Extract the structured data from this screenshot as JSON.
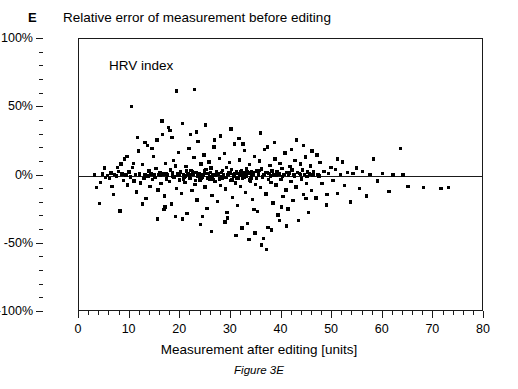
{
  "panel": {
    "letter": "E",
    "caption": "Figure 3E"
  },
  "chart_data": {
    "type": "scatter",
    "title": "Relative error of measurement before editing",
    "annotation": "HRV index",
    "xlabel": "Measurement after editing [units]",
    "ylabel": "",
    "xlim": [
      0,
      80
    ],
    "ylim": [
      -100,
      100
    ],
    "x_major_ticks": [
      0,
      10,
      20,
      30,
      40,
      50,
      60,
      70,
      80
    ],
    "x_tick_labels": [
      "0",
      "10",
      "20",
      "30",
      "40",
      "50",
      "60",
      "70",
      "80"
    ],
    "x_minor_interval": 2,
    "y_major_ticks": [
      100,
      50,
      0,
      -50,
      -100
    ],
    "y_tick_labels": [
      "100%",
      "50%",
      "0%",
      "-50%",
      "-100%"
    ],
    "y_minor_interval": 10,
    "grid": false,
    "legend": null,
    "reference_line": {
      "y": 0,
      "style": "solid",
      "color": "#1a1a1a"
    },
    "marker": {
      "shape": "square",
      "color": "#000000",
      "size_px": 3.4
    },
    "n_points": 520,
    "points": [
      [
        3.1,
        0.5
      ],
      [
        3.4,
        -9.0
      ],
      [
        4.0,
        -20.5
      ],
      [
        4.6,
        1.0
      ],
      [
        5.2,
        -1.5
      ],
      [
        5.6,
        0.2
      ],
      [
        6.0,
        -2.0
      ],
      [
        6.3,
        1.8
      ],
      [
        6.8,
        -14.0
      ],
      [
        7.0,
        0.8
      ],
      [
        7.4,
        -0.5
      ],
      [
        7.8,
        3.0
      ],
      [
        8.1,
        -26.0
      ],
      [
        8.5,
        1.2
      ],
      [
        8.8,
        -3.5
      ],
      [
        9.0,
        12.0
      ],
      [
        9.3,
        0.4
      ],
      [
        9.6,
        -7.0
      ],
      [
        9.9,
        2.5
      ],
      [
        10.2,
        -1.0
      ],
      [
        10.4,
        50.5
      ],
      [
        10.6,
        6.0
      ],
      [
        10.9,
        -4.0
      ],
      [
        11.1,
        0.6
      ],
      [
        11.4,
        -12.0
      ],
      [
        11.7,
        18.0
      ],
      [
        11.9,
        1.5
      ],
      [
        12.2,
        -5.5
      ],
      [
        12.5,
        8.0
      ],
      [
        12.8,
        -2.2
      ],
      [
        13.0,
        0.3
      ],
      [
        13.2,
        -17.0
      ],
      [
        13.5,
        22.0
      ],
      [
        13.8,
        3.4
      ],
      [
        14.0,
        -8.0
      ],
      [
        14.2,
        1.0
      ],
      [
        14.5,
        -3.0
      ],
      [
        14.7,
        14.0
      ],
      [
        15.0,
        -1.5
      ],
      [
        15.2,
        5.0
      ],
      [
        15.4,
        26.0
      ],
      [
        15.6,
        -10.5
      ],
      [
        15.8,
        0.8
      ],
      [
        16.0,
        2.0
      ],
      [
        16.2,
        -6.0
      ],
      [
        16.5,
        30.0
      ],
      [
        16.7,
        1.2
      ],
      [
        16.9,
        -15.0
      ],
      [
        17.1,
        9.0
      ],
      [
        17.3,
        -2.5
      ],
      [
        17.5,
        0.5
      ],
      [
        17.7,
        35.0
      ],
      [
        17.9,
        -4.5
      ],
      [
        18.1,
        4.0
      ],
      [
        18.3,
        -21.0
      ],
      [
        18.5,
        1.8
      ],
      [
        18.7,
        11.0
      ],
      [
        18.9,
        -1.0
      ],
      [
        19.1,
        7.0
      ],
      [
        19.3,
        -9.5
      ],
      [
        19.5,
        0.2
      ],
      [
        19.7,
        17.0
      ],
      [
        19.9,
        -3.2
      ],
      [
        20.1,
        2.8
      ],
      [
        20.3,
        -13.0
      ],
      [
        20.5,
        38.0
      ],
      [
        20.7,
        0.9
      ],
      [
        20.9,
        -5.0
      ],
      [
        21.1,
        6.5
      ],
      [
        21.3,
        -28.0
      ],
      [
        21.5,
        1.4
      ],
      [
        21.7,
        20.0
      ],
      [
        21.9,
        -2.0
      ],
      [
        22.1,
        3.8
      ],
      [
        22.3,
        -11.0
      ],
      [
        22.5,
        0.6
      ],
      [
        22.7,
        13.0
      ],
      [
        22.9,
        -6.5
      ],
      [
        23.1,
        2.2
      ],
      [
        23.3,
        -18.0
      ],
      [
        23.5,
        25.0
      ],
      [
        23.7,
        1.0
      ],
      [
        23.9,
        -3.8
      ],
      [
        24.1,
        8.5
      ],
      [
        24.3,
        -1.2
      ],
      [
        24.5,
        0.4
      ],
      [
        24.7,
        15.0
      ],
      [
        24.9,
        -8.5
      ],
      [
        25.1,
        4.5
      ],
      [
        25.3,
        -24.0
      ],
      [
        25.5,
        1.6
      ],
      [
        25.7,
        10.0
      ],
      [
        25.9,
        -2.8
      ],
      [
        26.1,
        5.5
      ],
      [
        26.3,
        -14.5
      ],
      [
        26.5,
        0.7
      ],
      [
        26.7,
        21.0
      ],
      [
        26.9,
        -4.2
      ],
      [
        27.1,
        3.0
      ],
      [
        27.3,
        -19.0
      ],
      [
        27.5,
        1.1
      ],
      [
        27.7,
        12.5
      ],
      [
        27.9,
        -7.5
      ],
      [
        28.1,
        2.4
      ],
      [
        28.3,
        -1.8
      ],
      [
        28.5,
        0.3
      ],
      [
        28.7,
        16.0
      ],
      [
        28.9,
        -10.0
      ],
      [
        29.1,
        6.0
      ],
      [
        29.3,
        -31.0
      ],
      [
        29.5,
        1.9
      ],
      [
        29.7,
        9.5
      ],
      [
        29.9,
        -3.5
      ],
      [
        30.1,
        4.2
      ],
      [
        30.3,
        -16.0
      ],
      [
        30.5,
        0.8
      ],
      [
        30.7,
        23.0
      ],
      [
        30.9,
        -5.5
      ],
      [
        31.1,
        2.6
      ],
      [
        31.3,
        -22.0
      ],
      [
        31.5,
        1.3
      ],
      [
        31.7,
        11.5
      ],
      [
        31.9,
        -8.0
      ],
      [
        32.1,
        3.6
      ],
      [
        32.3,
        -2.4
      ],
      [
        32.5,
        0.5
      ],
      [
        32.7,
        18.5
      ],
      [
        32.9,
        -12.5
      ],
      [
        33.1,
        5.0
      ],
      [
        33.3,
        -35.0
      ],
      [
        33.5,
        1.7
      ],
      [
        33.7,
        8.0
      ],
      [
        33.9,
        -4.0
      ],
      [
        34.1,
        2.9
      ],
      [
        34.3,
        -17.5
      ],
      [
        34.5,
        0.6
      ],
      [
        34.7,
        14.0
      ],
      [
        34.9,
        -6.8
      ],
      [
        35.1,
        3.2
      ],
      [
        35.3,
        -26.5
      ],
      [
        35.5,
        1.0
      ],
      [
        35.7,
        10.5
      ],
      [
        35.9,
        -9.0
      ],
      [
        36.1,
        4.8
      ],
      [
        36.3,
        -1.5
      ],
      [
        36.5,
        0.9
      ],
      [
        36.7,
        19.0
      ],
      [
        36.9,
        -13.5
      ],
      [
        37.1,
        2.1
      ],
      [
        37.3,
        -38.0
      ],
      [
        37.5,
        1.5
      ],
      [
        37.7,
        7.5
      ],
      [
        37.9,
        -5.0
      ],
      [
        38.1,
        3.4
      ],
      [
        38.3,
        -20.0
      ],
      [
        38.5,
        0.4
      ],
      [
        38.7,
        12.0
      ],
      [
        38.9,
        -7.0
      ],
      [
        39.1,
        2.7
      ],
      [
        39.3,
        -29.0
      ],
      [
        39.5,
        1.2
      ],
      [
        39.7,
        9.0
      ],
      [
        39.9,
        -3.0
      ],
      [
        40.1,
        5.2
      ],
      [
        40.3,
        -15.5
      ],
      [
        40.5,
        0.7
      ],
      [
        40.7,
        16.5
      ],
      [
        40.9,
        -10.5
      ],
      [
        41.1,
        2.3
      ],
      [
        41.3,
        -24.5
      ],
      [
        41.5,
        1.8
      ],
      [
        41.7,
        6.5
      ],
      [
        41.9,
        -4.5
      ],
      [
        42.1,
        3.9
      ],
      [
        42.3,
        -18.5
      ],
      [
        42.5,
        0.5
      ],
      [
        42.7,
        11.0
      ],
      [
        42.9,
        -8.5
      ],
      [
        43.1,
        2.0
      ],
      [
        43.3,
        -33.0
      ],
      [
        43.5,
        1.4
      ],
      [
        43.7,
        8.5
      ],
      [
        43.9,
        -2.5
      ],
      [
        44.1,
        4.0
      ],
      [
        44.3,
        -14.0
      ],
      [
        44.5,
        0.8
      ],
      [
        44.7,
        13.5
      ],
      [
        44.9,
        -6.0
      ],
      [
        45.1,
        2.5
      ],
      [
        45.3,
        -27.0
      ],
      [
        45.5,
        1.1
      ],
      [
        45.7,
        7.0
      ],
      [
        45.9,
        -11.0
      ],
      [
        46.3,
        3.1
      ],
      [
        46.8,
        -16.5
      ],
      [
        47.2,
        0.6
      ],
      [
        47.6,
        9.5
      ],
      [
        48.0,
        -5.8
      ],
      [
        48.4,
        2.8
      ],
      [
        48.9,
        -21.5
      ],
      [
        49.3,
        1.3
      ],
      [
        49.8,
        6.0
      ],
      [
        50.2,
        -3.5
      ],
      [
        50.7,
        4.4
      ],
      [
        51.1,
        -13.0
      ],
      [
        51.6,
        0.9
      ],
      [
        52.0,
        10.0
      ],
      [
        52.5,
        -7.5
      ],
      [
        53.0,
        2.2
      ],
      [
        53.6,
        -19.5
      ],
      [
        54.1,
        1.6
      ],
      [
        54.8,
        5.5
      ],
      [
        55.4,
        -9.5
      ],
      [
        56.0,
        3.0
      ],
      [
        56.8,
        -15.0
      ],
      [
        57.5,
        0.8
      ],
      [
        58.2,
        12.0
      ],
      [
        59.0,
        -4.0
      ],
      [
        60.0,
        1.5
      ],
      [
        61.2,
        -11.5
      ],
      [
        62.0,
        0.4
      ],
      [
        63.5,
        20.0
      ],
      [
        64.0,
        0.5
      ],
      [
        65.0,
        -8.0
      ],
      [
        68.0,
        -9.0
      ],
      [
        71.5,
        -9.5
      ],
      [
        73.0,
        -9.0
      ],
      [
        12.0,
        0.1
      ],
      [
        13.6,
        -0.4
      ],
      [
        14.9,
        0.6
      ],
      [
        16.1,
        -0.2
      ],
      [
        17.4,
        0.9
      ],
      [
        18.6,
        -0.7
      ],
      [
        19.8,
        0.3
      ],
      [
        21.0,
        -0.5
      ],
      [
        22.2,
        0.8
      ],
      [
        23.4,
        -0.3
      ],
      [
        24.6,
        0.5
      ],
      [
        25.8,
        -0.9
      ],
      [
        27.0,
        0.2
      ],
      [
        28.2,
        -0.6
      ],
      [
        29.4,
        0.7
      ],
      [
        30.6,
        -0.4
      ],
      [
        31.8,
        0.3
      ],
      [
        33.0,
        -0.8
      ],
      [
        34.2,
        0.6
      ],
      [
        35.4,
        -0.2
      ],
      [
        36.6,
        0.9
      ],
      [
        37.8,
        -0.5
      ],
      [
        39.0,
        0.4
      ],
      [
        40.2,
        -0.7
      ],
      [
        41.4,
        0.2
      ],
      [
        42.6,
        -0.3
      ],
      [
        43.8,
        0.8
      ],
      [
        45.0,
        -0.6
      ],
      [
        46.2,
        0.5
      ],
      [
        47.4,
        -0.4
      ],
      [
        20.0,
        2.0
      ],
      [
        20.6,
        -2.6
      ],
      [
        21.2,
        3.2
      ],
      [
        21.8,
        -1.4
      ],
      [
        22.4,
        2.8
      ],
      [
        23.0,
        -3.6
      ],
      [
        23.6,
        1.6
      ],
      [
        24.2,
        -2.2
      ],
      [
        24.8,
        3.4
      ],
      [
        25.4,
        -1.8
      ],
      [
        26.0,
        2.4
      ],
      [
        26.6,
        -3.0
      ],
      [
        27.2,
        1.2
      ],
      [
        27.8,
        -2.6
      ],
      [
        28.4,
        3.8
      ],
      [
        29.0,
        -1.6
      ],
      [
        29.6,
        2.2
      ],
      [
        30.2,
        -3.4
      ],
      [
        30.8,
        1.4
      ],
      [
        31.4,
        -2.0
      ],
      [
        32.0,
        3.0
      ],
      [
        32.6,
        -1.2
      ],
      [
        33.2,
        2.6
      ],
      [
        33.8,
        -3.2
      ],
      [
        34.4,
        1.8
      ],
      [
        35.0,
        -2.4
      ],
      [
        35.6,
        3.6
      ],
      [
        36.2,
        -1.0
      ],
      [
        36.8,
        2.0
      ],
      [
        37.4,
        -2.8
      ],
      [
        15.5,
        -32.0
      ],
      [
        17.0,
        -23.0
      ],
      [
        19.0,
        -30.0
      ],
      [
        24.0,
        -36.0
      ],
      [
        26.2,
        -41.0
      ],
      [
        28.8,
        -34.0
      ],
      [
        31.0,
        -44.0
      ],
      [
        32.2,
        -38.5
      ],
      [
        33.6,
        -47.0
      ],
      [
        34.8,
        -42.0
      ],
      [
        36.0,
        -51.0
      ],
      [
        36.4,
        -46.0
      ],
      [
        37.0,
        -54.0
      ],
      [
        38.0,
        -40.0
      ],
      [
        39.6,
        -33.0
      ],
      [
        41.0,
        -37.0
      ],
      [
        19.2,
        62.0
      ],
      [
        22.8,
        63.0
      ],
      [
        16.4,
        40.0
      ],
      [
        18.0,
        33.0
      ],
      [
        23.2,
        32.0
      ],
      [
        25.0,
        37.0
      ],
      [
        28.0,
        29.0
      ],
      [
        30.0,
        34.0
      ],
      [
        31.6,
        27.0
      ],
      [
        35.8,
        31.0
      ],
      [
        38.6,
        24.0
      ],
      [
        43.0,
        26.0
      ],
      [
        44.4,
        22.0
      ],
      [
        46.0,
        18.0
      ],
      [
        11.5,
        28.0
      ],
      [
        13.0,
        24.0
      ],
      [
        9.5,
        14.0
      ],
      [
        10.8,
        9.0
      ],
      [
        7.6,
        6.0
      ],
      [
        6.5,
        -8.0
      ],
      [
        5.0,
        5.5
      ],
      [
        4.2,
        -5.0
      ],
      [
        8.3,
        8.5
      ],
      [
        12.6,
        -21.0
      ],
      [
        14.4,
        20.0
      ],
      [
        16.8,
        -25.0
      ],
      [
        18.4,
        28.0
      ],
      [
        20.4,
        -32.0
      ],
      [
        22.0,
        30.0
      ],
      [
        24.4,
        -30.0
      ],
      [
        26.8,
        26.0
      ],
      [
        29.2,
        -27.0
      ],
      [
        32.4,
        23.0
      ],
      [
        34.6,
        -25.0
      ],
      [
        37.2,
        21.0
      ],
      [
        40.0,
        -23.0
      ],
      [
        42.0,
        19.0
      ],
      [
        44.8,
        -17.0
      ],
      [
        47.0,
        15.0
      ],
      [
        49.0,
        -14.0
      ],
      [
        51.0,
        12.0
      ],
      [
        22.6,
        1.1
      ],
      [
        23.8,
        -1.1
      ],
      [
        25.2,
        1.3
      ],
      [
        26.4,
        -1.3
      ],
      [
        27.6,
        1.5
      ],
      [
        28.6,
        -1.5
      ],
      [
        29.8,
        1.7
      ],
      [
        31.2,
        -1.7
      ],
      [
        32.8,
        1.9
      ],
      [
        34.0,
        -1.9
      ],
      [
        17.2,
        1.0
      ],
      [
        18.8,
        -1.0
      ],
      [
        19.4,
        1.4
      ],
      [
        20.8,
        -1.4
      ],
      [
        21.6,
        1.2
      ]
    ]
  }
}
